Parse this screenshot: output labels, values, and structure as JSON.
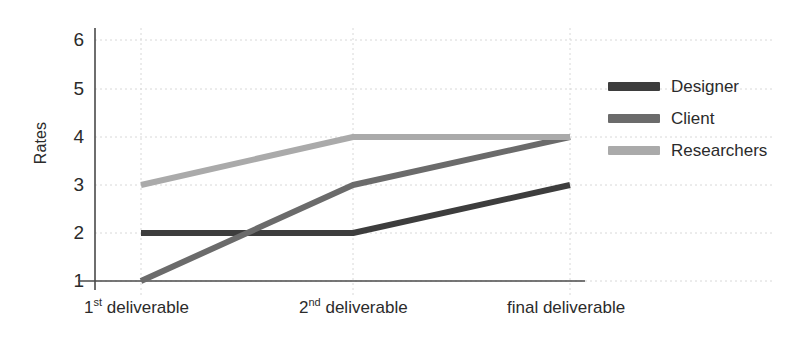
{
  "chart_data": {
    "type": "line",
    "title": "",
    "xlabel": "",
    "ylabel": "Rates",
    "categories": [
      "1st deliverable",
      "2nd deliverable",
      "final deliverable"
    ],
    "category_parts": [
      {
        "num": "1",
        "sup": "st",
        "rest": " deliverable"
      },
      {
        "num": "2",
        "sup": "nd",
        "rest": " deliverable"
      },
      {
        "num": "final",
        "sup": "",
        "rest": " deliverable"
      }
    ],
    "ylim": [
      1,
      6
    ],
    "yticks": [
      "6",
      "5",
      "4",
      "3",
      "2",
      "1"
    ],
    "ytick_values": [
      6,
      5,
      4,
      3,
      2,
      1
    ],
    "grid": true,
    "grid_style": "dotted",
    "grid_color": "#d8d8d8",
    "axis_color": "#4a4a4a",
    "background": "#ffffff",
    "legend_position": "right",
    "series": [
      {
        "name": "Designer",
        "values": [
          2,
          2,
          3
        ],
        "color": "#3d3d3d"
      },
      {
        "name": "Client",
        "values": [
          1,
          3,
          4
        ],
        "color": "#6b6b6b"
      },
      {
        "name": "Researchers",
        "values": [
          3,
          4,
          4
        ],
        "color": "#aaaaaa"
      }
    ]
  },
  "legend": {
    "items": [
      {
        "label": "Designer",
        "color": "#3d3d3d"
      },
      {
        "label": "Client",
        "color": "#6b6b6b"
      },
      {
        "label": "Researchers",
        "color": "#aaaaaa"
      }
    ]
  }
}
